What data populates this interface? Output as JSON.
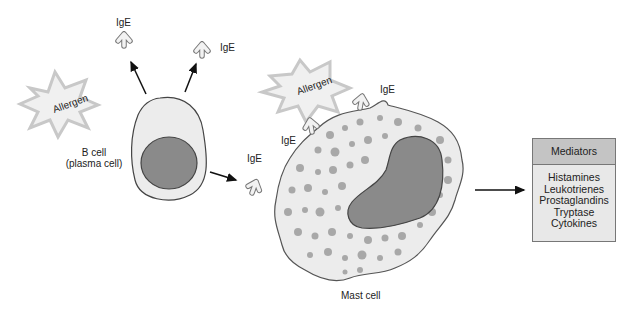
{
  "labels": {
    "ige_top_left": "IgE",
    "ige_top_right": "IgE",
    "ige_free": "IgE",
    "ige_mast_left": "IgE",
    "ige_mast_top": "IgE",
    "allergen_left": "Allergen",
    "allergen_right": "Allergen",
    "b_cell_line1": "B cell",
    "b_cell_line2": "(plasma cell)",
    "mast_cell": "Mast cell"
  },
  "mediators": {
    "title": "Mediators",
    "items": [
      "Histamines",
      "Leukotrienes",
      "Prostaglandins",
      "Tryptase",
      "Cytokines"
    ]
  },
  "colors": {
    "cell_fill": "#ececec",
    "nucleus_fill": "#8a8a8a",
    "granule_fill": "#a8a8a8",
    "allergen_fill": "#f0f0f0",
    "allergen_stroke": "#c8c8c8",
    "header_fill": "#c4c4c4",
    "box_fill": "#e8e8e8"
  }
}
